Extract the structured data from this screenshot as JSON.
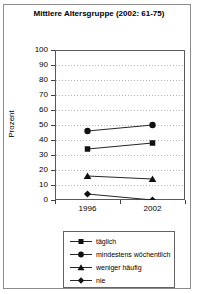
{
  "figure": {
    "title": "Mittlere Altersgruppe (2002: 61-75)"
  },
  "colors": {
    "frame_border": "#8c8c8c",
    "plot_border": "#595959",
    "gridline": "#b3b3b3",
    "series_line": "#262626",
    "marker_fill": "#111111"
  },
  "chart_data": {
    "type": "line",
    "title": "Mittlere Altersgruppe (2002: 61-75)",
    "xlabel": "",
    "ylabel": "Prozent",
    "categories": [
      "1996",
      "2002"
    ],
    "series": [
      {
        "name": "täglich",
        "marker": "square",
        "values": [
          34,
          38
        ]
      },
      {
        "name": "mindestens wöchentlich",
        "marker": "circle",
        "values": [
          46,
          50
        ]
      },
      {
        "name": "weniger häufig",
        "marker": "triangle",
        "values": [
          16,
          14
        ]
      },
      {
        "name": "nie",
        "marker": "diamond",
        "values": [
          4,
          0
        ]
      }
    ],
    "ylim": [
      0,
      100
    ],
    "yticks": [
      0,
      10,
      20,
      30,
      40,
      50,
      60,
      70,
      80,
      90,
      100
    ],
    "grid": true,
    "legend_position": "bottom"
  }
}
